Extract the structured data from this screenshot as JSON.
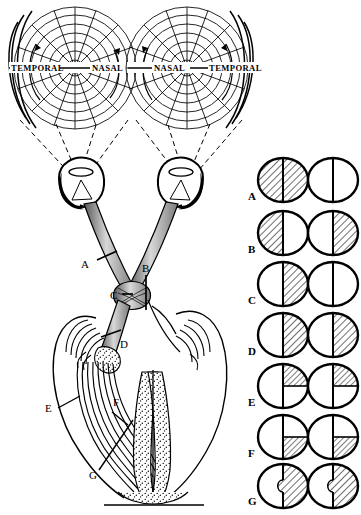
{
  "figure": {
    "type": "anatomical-diagram"
  },
  "field_charts": {
    "left": {
      "name": "left-eye-visual-field-chart",
      "label_outer": "TEMPORAL",
      "label_inner": "NASAL"
    },
    "right": {
      "name": "right-eye-visual-field-chart",
      "label_inner": "NASAL",
      "label_outer": "TEMPORAL"
    }
  },
  "lesion_markers": [
    {
      "id": "A",
      "label": "A",
      "site": "optic-nerve"
    },
    {
      "id": "B",
      "label": "B",
      "site": "optic-chiasm-midline"
    },
    {
      "id": "C",
      "label": "C",
      "site": "optic-chiasm-lateral"
    },
    {
      "id": "D",
      "label": "D",
      "site": "optic-tract"
    },
    {
      "id": "E",
      "label": "E",
      "site": "optic-radiation-upper"
    },
    {
      "id": "F",
      "label": "F",
      "site": "optic-radiation-lower"
    },
    {
      "id": "G",
      "label": "G",
      "site": "occipital-cortex"
    }
  ],
  "defect_rows": [
    {
      "label": "A",
      "defect": "total-blindness-one-eye",
      "left_eye": "full",
      "right_eye": "none"
    },
    {
      "label": "B",
      "defect": "bitemporal-hemianopia",
      "left_eye": "left-half",
      "right_eye": "right-half"
    },
    {
      "label": "C",
      "defect": "nasal-hemianopia-one-eye",
      "left_eye": "right-half",
      "right_eye": "none"
    },
    {
      "label": "D",
      "defect": "homonymous-hemianopia",
      "left_eye": "right-half",
      "right_eye": "right-half"
    },
    {
      "label": "E",
      "defect": "upper-homonymous-quadrantanopia",
      "left_eye": "upper-right-quadrant",
      "right_eye": "upper-right-quadrant"
    },
    {
      "label": "F",
      "defect": "lower-homonymous-quadrantanopia",
      "left_eye": "lower-right-quadrant",
      "right_eye": "lower-right-quadrant"
    },
    {
      "label": "G",
      "defect": "homonymous-hemianopia-macular-sparing",
      "left_eye": "right-half-macular-sparing",
      "right_eye": "right-half-macular-sparing"
    }
  ],
  "colors": {
    "ink": "#000000",
    "paper": "#ffffff",
    "hatch": "#000000",
    "shade": "#b4b4b4"
  }
}
